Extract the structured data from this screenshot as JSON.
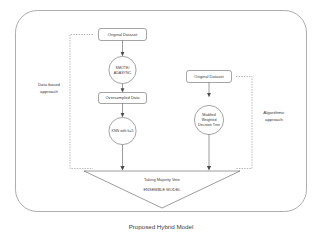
{
  "figure": {
    "caption": "Proposed Hybrid Model",
    "colors": {
      "background": "#ffffff",
      "frame_stroke": "#89898b",
      "shape_stroke": "#59595b",
      "connector": "#4a4a4c",
      "bracket": "#6e6e70",
      "text": "#3a3a3a"
    }
  },
  "left_branch": {
    "label_line1": "Data based",
    "label_line2": "approach",
    "nodes": [
      {
        "id": "orig-dataset-left",
        "shape": "rounded-rect",
        "label": "Original Dataset"
      },
      {
        "id": "smote-adasync",
        "shape": "circle",
        "label_line1": "SMOTE/",
        "label_line2": "ADASYNC"
      },
      {
        "id": "oversampled-data",
        "shape": "rounded-rect",
        "label": "Oversampled Data"
      },
      {
        "id": "knn",
        "shape": "circle",
        "label": "KNN with k=5"
      }
    ]
  },
  "right_branch": {
    "label_line1": "Algorithmic",
    "label_line2": "approach",
    "nodes": [
      {
        "id": "orig-dataset-right",
        "shape": "rounded-rect",
        "label": "Original Dataset"
      },
      {
        "id": "modified-weighted-decision-tree",
        "shape": "circle",
        "label_line1": "Modified",
        "label_line2": "Weighted",
        "label_line3": "Decision Tree"
      }
    ]
  },
  "ensemble": {
    "shape": "down-triangle",
    "line1": "Taking Majority Vote",
    "line2": "ENSEMBLE MODEL"
  }
}
